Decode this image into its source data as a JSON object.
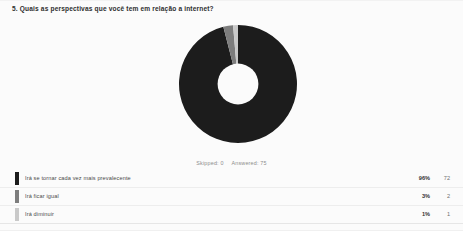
{
  "question": {
    "number": "5.",
    "title": "5. Quais as perspectivas que você tem em relação a internet?"
  },
  "meta": {
    "skipped_label": "Skipped: 0",
    "answered_label": "Answered: 75"
  },
  "colors": {
    "slice_1": "#1c1c1c",
    "slice_2": "#7d7d7d",
    "slice_3": "#c9c9c9",
    "background": "#fbfbfb",
    "page_background": "#ffffff"
  },
  "legend": {
    "rows": [
      {
        "label": "Irá se tornar cada vez mais prevalecente",
        "percent": "96%",
        "count": "72",
        "color": "#1c1c1c"
      },
      {
        "label": "Irá ficar igual",
        "percent": "3%",
        "count": "2",
        "color": "#7d7d7d"
      },
      {
        "label": "Irá diminuir",
        "percent": "1%",
        "count": "1",
        "color": "#c9c9c9"
      }
    ]
  },
  "chart_data": {
    "type": "pie",
    "title": "5. Quais as perspectivas que você tem em relação a internet?",
    "subtitle": "Skipped: 0  Answered: 75",
    "donut": true,
    "inner_radius_ratio": 0.34,
    "start_angle_deg": -90,
    "total_responses": 75,
    "categories": [
      "Irá se tornar cada vez mais prevalecente",
      "Irá ficar igual",
      "Irá diminuir"
    ],
    "values": [
      72,
      2,
      1
    ],
    "percentages": [
      96,
      3,
      1
    ],
    "colors": [
      "#1c1c1c",
      "#7d7d7d",
      "#c9c9c9"
    ],
    "legend_position": "bottom",
    "grid": false,
    "xlabel": "",
    "ylabel": ""
  }
}
